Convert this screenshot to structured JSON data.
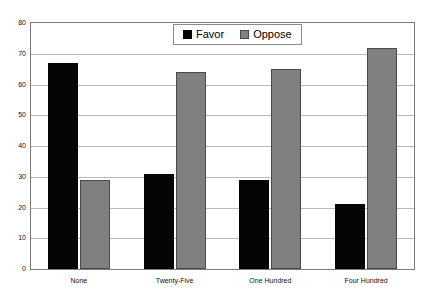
{
  "chart_data": {
    "type": "bar",
    "title": "",
    "subtitle": "",
    "xlabel": "",
    "ylabel": "",
    "categories": [
      "None",
      "Twenty-Five",
      "One Hundred",
      "Four Hundred"
    ],
    "series": [
      {
        "name": "Favor",
        "color": "#050505",
        "values": [
          67,
          31,
          29,
          21
        ]
      },
      {
        "name": "Oppose",
        "color": "#808080",
        "values": [
          29,
          64,
          65,
          72
        ]
      }
    ],
    "ylim": [
      0,
      80
    ],
    "ytick_step": 10,
    "yticks": [
      0,
      10,
      20,
      30,
      40,
      50,
      60,
      70,
      80
    ],
    "ytick_labels": [
      "0",
      "10",
      "20",
      "30",
      "40",
      "50",
      "60",
      "70",
      "80"
    ],
    "grid": true,
    "grid_axis": "y",
    "legend": {
      "position": "top-center",
      "entries": [
        {
          "label": "Favor",
          "color": "#050505"
        },
        {
          "label": "Oppose",
          "color": "#808080"
        }
      ]
    },
    "annotations": [],
    "plot_background": "#ffffff",
    "frame_color": "#7a7a7a",
    "gridline_color": "#b9b9b9"
  }
}
